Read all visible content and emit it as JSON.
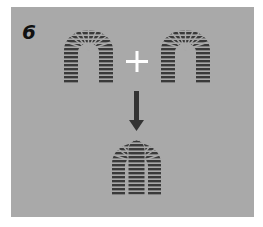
{
  "diagram": {
    "step_number": "6",
    "colors": {
      "background": "#a9a9a9",
      "arch": "#3a3a3a",
      "plus": "#ffffff",
      "arrow": "#333333"
    },
    "elements": [
      {
        "id": "arch-left",
        "type": "arch"
      },
      {
        "id": "plus",
        "type": "operator",
        "symbol": "+"
      },
      {
        "id": "arch-right",
        "type": "arch"
      },
      {
        "id": "arrow",
        "type": "arrow",
        "direction": "down"
      },
      {
        "id": "arch-combined",
        "type": "combined-arch"
      }
    ]
  }
}
